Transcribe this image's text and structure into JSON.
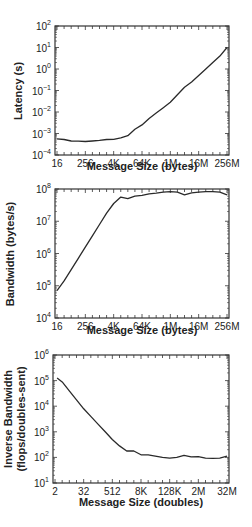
{
  "chart_data": [
    {
      "type": "line",
      "title": "",
      "xlabel": "Message Size (bytes)",
      "ylabel": "Latency (s)",
      "xscale": "log2",
      "yscale": "log10",
      "xlim_log2": [
        4,
        28
      ],
      "ylim_log10": [
        -4,
        2
      ],
      "x_ticks": [
        {
          "log2": 4,
          "label": "16"
        },
        {
          "log2": 8,
          "label": "256"
        },
        {
          "log2": 12,
          "label": "4K"
        },
        {
          "log2": 16,
          "label": "64K"
        },
        {
          "log2": 20,
          "label": "1M"
        },
        {
          "log2": 24,
          "label": "16M"
        },
        {
          "log2": 28,
          "label": "256M"
        }
      ],
      "y_ticks": [
        -4,
        -3,
        -2,
        -1,
        0,
        1,
        2
      ],
      "grid": false,
      "frame": {
        "left": 55,
        "right": 229,
        "top": 26,
        "bottom": 155
      },
      "series": [
        {
          "name": "Latency",
          "x_log2": [
            4,
            5,
            6,
            7,
            8,
            9,
            10,
            11,
            12,
            13,
            14,
            15,
            16,
            17,
            18,
            19,
            20,
            21,
            22,
            23,
            24,
            25,
            26,
            27,
            28
          ],
          "y_log10": [
            -3.25,
            -3.28,
            -3.35,
            -3.36,
            -3.37,
            -3.35,
            -3.32,
            -3.28,
            -3.27,
            -3.2,
            -3.1,
            -2.8,
            -2.6,
            -2.3,
            -2.05,
            -1.8,
            -1.55,
            -1.2,
            -0.85,
            -0.6,
            -0.3,
            0.0,
            0.3,
            0.6,
            1.0
          ]
        }
      ]
    },
    {
      "type": "line",
      "title": "",
      "xlabel": "Message Size (bytes)",
      "ylabel": "Bandwidth (bytes/s)",
      "xscale": "log2",
      "yscale": "log10",
      "xlim_log2": [
        4,
        28
      ],
      "ylim_log10": [
        4,
        8
      ],
      "x_ticks": [
        {
          "log2": 4,
          "label": "16"
        },
        {
          "log2": 8,
          "label": "256"
        },
        {
          "log2": 12,
          "label": "4K"
        },
        {
          "log2": 16,
          "label": "64K"
        },
        {
          "log2": 20,
          "label": "1M"
        },
        {
          "log2": 24,
          "label": "16M"
        },
        {
          "log2": 28,
          "label": "256M"
        }
      ],
      "y_ticks": [
        4,
        5,
        6,
        7,
        8
      ],
      "grid": false,
      "frame": {
        "left": 55,
        "right": 229,
        "top": 189,
        "bottom": 318
      },
      "series": [
        {
          "name": "Bandwidth",
          "x_log2": [
            4,
            5,
            6,
            7,
            8,
            9,
            10,
            11,
            12,
            13,
            14,
            15,
            16,
            17,
            18,
            19,
            20,
            21,
            22,
            23,
            24,
            25,
            26,
            27,
            28
          ],
          "y_log10": [
            4.85,
            5.15,
            5.5,
            5.85,
            6.2,
            6.55,
            6.9,
            7.25,
            7.55,
            7.75,
            7.7,
            7.78,
            7.8,
            7.85,
            7.87,
            7.9,
            7.92,
            7.9,
            7.82,
            7.88,
            7.9,
            7.92,
            7.92,
            7.9,
            7.82
          ]
        }
      ]
    },
    {
      "type": "line",
      "title": "",
      "xlabel": "Message Size (doubles)",
      "ylabel": "Inverse Bandwidth (flops/doubles-sent)",
      "xscale": "log2",
      "yscale": "log10",
      "xlim_log2": [
        1,
        25
      ],
      "ylim_log10": [
        1,
        6
      ],
      "x_ticks": [
        {
          "log2": 1,
          "label": "2"
        },
        {
          "log2": 5,
          "label": "32"
        },
        {
          "log2": 9,
          "label": "512"
        },
        {
          "log2": 13,
          "label": "8K"
        },
        {
          "log2": 17,
          "label": "128K"
        },
        {
          "log2": 21,
          "label": "2M"
        },
        {
          "log2": 25,
          "label": "32M"
        }
      ],
      "y_ticks": [
        1,
        2,
        3,
        4,
        5,
        6
      ],
      "grid": false,
      "frame": {
        "left": 53,
        "right": 229,
        "top": 355,
        "bottom": 483
      },
      "series": [
        {
          "name": "Inverse Bandwidth",
          "x_log2": [
            1.3,
            2,
            3,
            4,
            5,
            6,
            7,
            8,
            9,
            10,
            11,
            12,
            13,
            14,
            15,
            16,
            17,
            18,
            19,
            20,
            21,
            22,
            23,
            24,
            25
          ],
          "y_log10": [
            5.1,
            4.95,
            4.6,
            4.25,
            3.9,
            3.6,
            3.3,
            3.0,
            2.7,
            2.45,
            2.25,
            2.25,
            2.1,
            2.1,
            2.05,
            2.0,
            1.97,
            2.0,
            2.08,
            2.02,
            2.03,
            1.97,
            1.96,
            1.97,
            2.05
          ]
        }
      ]
    }
  ],
  "labels": {
    "plot1_xlabel": "Message Size (bytes)",
    "plot1_ylabel": "Latency (s)",
    "plot2_xlabel": "Message Size (bytes)",
    "plot2_ylabel": "Bandwidth (bytes/s)",
    "plot3_xlabel": "Message Size (doubles)",
    "plot3_ylabel_line1": "Inverse Bandwidth",
    "plot3_ylabel_line2": "(flops/doubles-sent)"
  },
  "colors": {
    "line": "#2a2a2a",
    "axis": "#333333",
    "text": "#222222",
    "background": "#ffffff"
  }
}
